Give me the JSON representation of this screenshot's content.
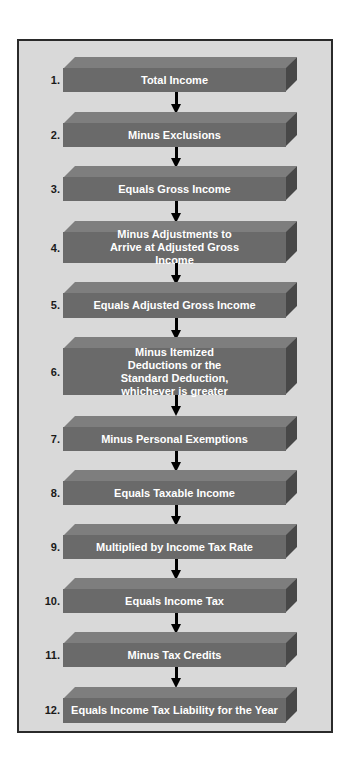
{
  "diagram": {
    "type": "flowchart",
    "direction": "top-to-bottom",
    "colors": {
      "background": "#d9d9d9",
      "frame_border": "#2a2a2a",
      "box_front": "#6a6a6a",
      "box_top": "#7e7e7e",
      "box_side": "#484848",
      "box_text": "#ffffff",
      "number_text": "#1a1a1a",
      "arrow": "#000000"
    },
    "steps": [
      {
        "number": "1.",
        "label": "Total Income"
      },
      {
        "number": "2.",
        "label": "Minus Exclusions"
      },
      {
        "number": "3.",
        "label": "Equals Gross Income"
      },
      {
        "number": "4.",
        "label": "Minus Adjustments to Arrive at Adjusted Gross Income"
      },
      {
        "number": "5.",
        "label": "Equals Adjusted Gross Income"
      },
      {
        "number": "6.",
        "label": "Minus Itemized Deductions or the Standard Deduction, whichever is greater"
      },
      {
        "number": "7.",
        "label": "Minus Personal Exemptions"
      },
      {
        "number": "8.",
        "label": "Equals Taxable Income"
      },
      {
        "number": "9.",
        "label": "Multiplied by Income Tax Rate"
      },
      {
        "number": "10.",
        "label": "Equals Income Tax"
      },
      {
        "number": "11.",
        "label": "Minus Tax Credits"
      },
      {
        "number": "12.",
        "label": "Equals Income Tax Liability for the Year"
      }
    ],
    "edges": [
      [
        "1.",
        "2."
      ],
      [
        "2.",
        "3."
      ],
      [
        "3.",
        "4."
      ],
      [
        "4.",
        "5."
      ],
      [
        "5.",
        "6."
      ],
      [
        "6.",
        "7."
      ],
      [
        "7.",
        "8."
      ],
      [
        "8.",
        "9."
      ],
      [
        "9.",
        "10."
      ],
      [
        "10.",
        "11."
      ],
      [
        "11.",
        "12."
      ]
    ]
  }
}
